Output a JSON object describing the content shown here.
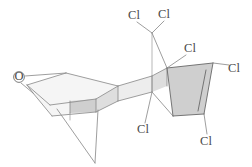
{
  "figure": {
    "kind": "chemical-structure-diagram",
    "width": 252,
    "height": 167,
    "background_color": "#ffffff"
  },
  "palette": {
    "bond_stroke": "#8d8d8d",
    "bond_stroke_dark": "#6f6f6f",
    "label_color": "#4a4a4a",
    "face_light": "#ededed",
    "face_mid": "#dedede",
    "face_dark": "#cfcfcf",
    "face_pale": "#f5f5f5"
  },
  "atom_labels": [
    {
      "id": "o-epoxide",
      "text": "O",
      "x": 19,
      "y": 77,
      "element": "oxygen"
    },
    {
      "id": "cl-top-left",
      "text": "Cl",
      "x": 134,
      "y": 16,
      "element": "chlorine"
    },
    {
      "id": "cl-top-right",
      "text": "Cl",
      "x": 164,
      "y": 15,
      "element": "chlorine"
    },
    {
      "id": "cl-upper-right",
      "text": "Cl",
      "x": 190,
      "y": 49,
      "element": "chlorine"
    },
    {
      "id": "cl-far-right",
      "text": "Cl",
      "x": 234,
      "y": 69,
      "element": "chlorine"
    },
    {
      "id": "cl-bottom-mid",
      "text": "Cl",
      "x": 143,
      "y": 130,
      "element": "chlorine"
    },
    {
      "id": "cl-bottom-right",
      "text": "Cl",
      "x": 206,
      "y": 142,
      "element": "chlorine"
    }
  ],
  "counts": {
    "chlorine_atoms": 6,
    "oxygen_atoms": 1
  }
}
